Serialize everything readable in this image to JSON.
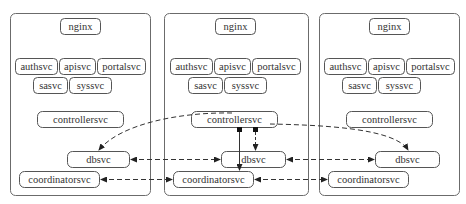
{
  "diagram": {
    "type": "deployment-architecture",
    "clusters": [
      {
        "id": "left",
        "nodes": {
          "nginx": "nginx",
          "authsvc": "authsvc",
          "apisvc": "apisvc",
          "portalsvc": "portalsvc",
          "sasvc": "sasvc",
          "syssvc": "syssvc",
          "controllersvc": "controllersvc",
          "dbsvc": "dbsvc",
          "coordinatorsvc": "coordinatorsvc"
        }
      },
      {
        "id": "middle",
        "nodes": {
          "nginx": "nginx",
          "authsvc": "authsvc",
          "apisvc": "apisvc",
          "portalsvc": "portalsvc",
          "sasvc": "sasvc",
          "syssvc": "syssvc",
          "controllersvc": "controllersvc",
          "dbsvc": "dbsvc",
          "coordinatorsvc": "coordinatorsvc"
        }
      },
      {
        "id": "right",
        "nodes": {
          "nginx": "nginx",
          "authsvc": "authsvc",
          "apisvc": "apisvc",
          "portalsvc": "portalsvc",
          "sasvc": "sasvc",
          "syssvc": "syssvc",
          "controllersvc": "controllersvc",
          "dbsvc": "dbsvc",
          "coordinatorsvc": "coordinatorsvc"
        }
      }
    ],
    "edges": [
      {
        "from": "middle.controllersvc",
        "to": "left.dbsvc",
        "style": "dashed",
        "arrow": "end"
      },
      {
        "from": "middle.controllersvc",
        "to": "right.dbsvc",
        "style": "dashed",
        "arrow": "end"
      },
      {
        "from": "middle.controllersvc",
        "to": "middle.dbsvc",
        "style": "dashed",
        "arrow": "end",
        "tail": "square"
      },
      {
        "from": "middle.controllersvc",
        "to": "middle.coordinatorsvc",
        "style": "solid",
        "arrow": "end",
        "tail": "square"
      },
      {
        "from": "middle.dbsvc",
        "to": "left.dbsvc",
        "style": "dashed",
        "arrow": "both"
      },
      {
        "from": "right.dbsvc",
        "to": "middle.dbsvc",
        "style": "dashed",
        "arrow": "both"
      },
      {
        "from": "left.coordinatorsvc",
        "to": "middle.coordinatorsvc",
        "style": "dashed",
        "arrow": "both"
      },
      {
        "from": "middle.coordinatorsvc",
        "to": "right.coordinatorsvc",
        "style": "dashed",
        "arrow": "both"
      }
    ],
    "colors": {
      "cluster_border": "#6b6b6b",
      "node_border": "#555555",
      "text": "#333333",
      "edge": "#333333"
    }
  }
}
